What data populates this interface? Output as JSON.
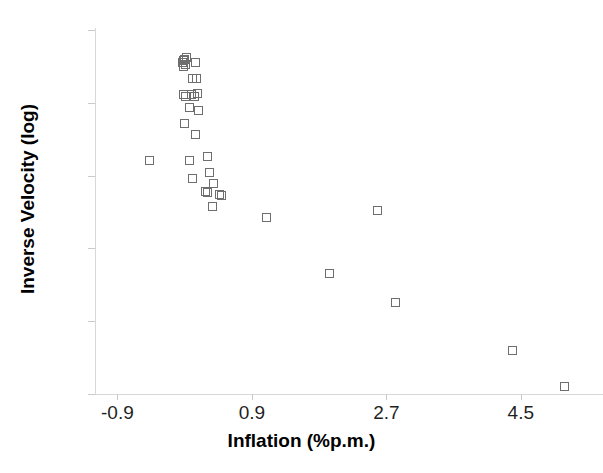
{
  "chart_data": {
    "type": "scatter",
    "title": "",
    "xlabel": "Inflation (%p.m.)",
    "ylabel": "Inverse Velocity (log)",
    "xlim": [
      -1.2,
      5.6
    ],
    "ylim": [
      2,
      7
    ],
    "xticks": [
      -0.9,
      0.9,
      2.7,
      4.5
    ],
    "xtick_labels": [
      "-0.9",
      "0.9",
      "2.7",
      "4.5"
    ],
    "yticks": [
      2,
      3,
      4,
      5,
      6,
      7
    ],
    "ytick_labels": [
      "2",
      "3",
      "4",
      "5",
      "6",
      "7"
    ],
    "grid": false,
    "legend": null,
    "marker": {
      "shape": "open-square",
      "edge_color": "#6e6e6e",
      "fill_color": "none",
      "size_px": 9
    },
    "series": [
      {
        "name": "Observations",
        "points": [
          {
            "x": -0.02,
            "y": 6.58
          },
          {
            "x": -0.03,
            "y": 6.55
          },
          {
            "x": 0.0,
            "y": 6.6
          },
          {
            "x": 0.01,
            "y": 6.52
          },
          {
            "x": -0.01,
            "y": 6.5
          },
          {
            "x": 0.02,
            "y": 6.62
          },
          {
            "x": 0.15,
            "y": 6.56
          },
          {
            "x": 0.11,
            "y": 6.33
          },
          {
            "x": 0.16,
            "y": 6.33
          },
          {
            "x": -0.02,
            "y": 6.11
          },
          {
            "x": 0.01,
            "y": 6.08
          },
          {
            "x": 0.09,
            "y": 6.12
          },
          {
            "x": 0.13,
            "y": 6.09
          },
          {
            "x": 0.17,
            "y": 6.13
          },
          {
            "x": 0.06,
            "y": 5.94
          },
          {
            "x": 0.19,
            "y": 5.89
          },
          {
            "x": 0.0,
            "y": 5.71
          },
          {
            "x": 0.14,
            "y": 5.56
          },
          {
            "x": -0.47,
            "y": 5.21
          },
          {
            "x": 0.07,
            "y": 5.21
          },
          {
            "x": 0.31,
            "y": 5.26
          },
          {
            "x": 0.33,
            "y": 5.04
          },
          {
            "x": 0.1,
            "y": 4.96
          },
          {
            "x": 0.39,
            "y": 4.89
          },
          {
            "x": 0.28,
            "y": 4.78
          },
          {
            "x": 0.3,
            "y": 4.77
          },
          {
            "x": 0.46,
            "y": 4.74
          },
          {
            "x": 0.49,
            "y": 4.73
          },
          {
            "x": 0.37,
            "y": 4.58
          },
          {
            "x": 1.1,
            "y": 4.42
          },
          {
            "x": 2.58,
            "y": 4.52
          },
          {
            "x": 1.94,
            "y": 3.66
          },
          {
            "x": 2.82,
            "y": 3.26
          },
          {
            "x": 4.39,
            "y": 2.6
          },
          {
            "x": 5.08,
            "y": 2.1
          }
        ]
      }
    ]
  },
  "axes": {
    "x_title": "Inflation (%p.m.)",
    "y_title": "Inverse Velocity (log)"
  }
}
